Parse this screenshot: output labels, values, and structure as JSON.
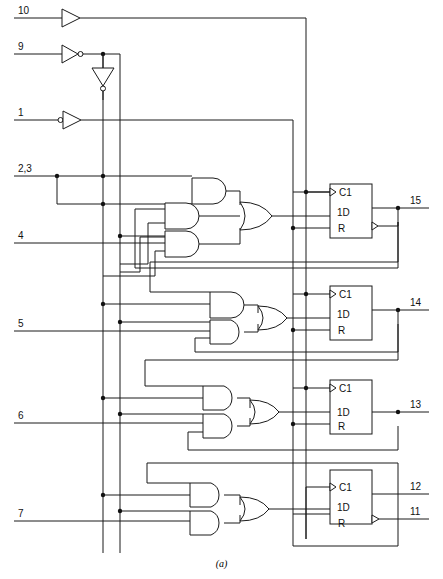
{
  "figure": {
    "caption": "(a)",
    "type": "logic-diagram",
    "colors": {
      "line": "#1a1a1a",
      "background": "#ffffff",
      "junction": "#111111"
    }
  },
  "inputs": [
    {
      "pin": "10",
      "y": 18,
      "buffer": "buffer",
      "role": "clock-input"
    },
    {
      "pin": "9",
      "y": 54,
      "buffer": "inverting-buffer",
      "role": "enable-input"
    },
    {
      "pin": "1",
      "y": 120,
      "buffer": "inverting-buffer",
      "role": "reset-input"
    },
    {
      "pin": "2,3",
      "y": 176,
      "buffer": "none",
      "role": "data-input"
    },
    {
      "pin": "4",
      "y": 243,
      "buffer": "none",
      "role": "data-input"
    },
    {
      "pin": "5",
      "y": 331,
      "buffer": "none",
      "role": "data-input"
    },
    {
      "pin": "6",
      "y": 423,
      "buffer": "none",
      "role": "data-input"
    },
    {
      "pin": "7",
      "y": 521,
      "buffer": "none",
      "role": "data-input"
    }
  ],
  "outputs": [
    {
      "pin": "15",
      "y": 208
    },
    {
      "pin": "14",
      "y": 310
    },
    {
      "pin": "13",
      "y": 424
    },
    {
      "pin": "12",
      "y": 494
    },
    {
      "pin": "11",
      "y": 519
    }
  ],
  "flipflops": [
    {
      "name": "ff-1",
      "labels": {
        "clock": "C1",
        "data": "1D",
        "reset": "R"
      },
      "x": 330,
      "y": 184,
      "w": 42,
      "h": 54,
      "output_pin": "15"
    },
    {
      "name": "ff-2",
      "labels": {
        "clock": "C1",
        "data": "1D",
        "reset": "R"
      },
      "x": 330,
      "y": 286,
      "w": 42,
      "h": 54,
      "output_pin": "14"
    },
    {
      "name": "ff-3",
      "labels": {
        "clock": "C1",
        "data": "1D",
        "reset": "R"
      },
      "x": 330,
      "y": 380,
      "w": 42,
      "h": 54,
      "output_pin": "13"
    },
    {
      "name": "ff-4",
      "labels": {
        "clock": "C1",
        "data": "1D",
        "reset": "R"
      },
      "x": 330,
      "y": 470,
      "w": 42,
      "h": 54,
      "output_pin": "12"
    }
  ],
  "gate_groups": [
    {
      "name": "group-1",
      "and_gates": 3,
      "or_inputs": 3,
      "feeds": "ff-1"
    },
    {
      "name": "group-2",
      "and_gates": 2,
      "or_inputs": 2,
      "feeds": "ff-2"
    },
    {
      "name": "group-3",
      "and_gates": 2,
      "or_inputs": 2,
      "feeds": "ff-3"
    },
    {
      "name": "group-4",
      "and_gates": 2,
      "or_inputs": 2,
      "feeds": "ff-4"
    }
  ],
  "buses": [
    {
      "name": "enable-bus",
      "x": 103,
      "orientation": "vertical"
    },
    {
      "name": "enable-not-bus",
      "x": 120,
      "orientation": "vertical"
    },
    {
      "name": "reset-bus",
      "x": 293,
      "orientation": "vertical"
    },
    {
      "name": "clock-bus",
      "x": 306,
      "orientation": "vertical"
    }
  ]
}
